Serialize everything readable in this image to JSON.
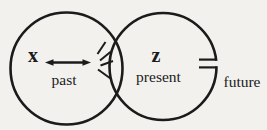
{
  "colors": {
    "background": "#f2f1ee",
    "ink": "#1b1b1b"
  },
  "labels": {
    "x_variable": "x",
    "past": "past",
    "z_variable": "z",
    "present": "present",
    "future": "future"
  },
  "icons": {
    "double_arrow": "left-right-arrow",
    "rays": "radiating-lines",
    "capacitor": "capacitor-break"
  }
}
